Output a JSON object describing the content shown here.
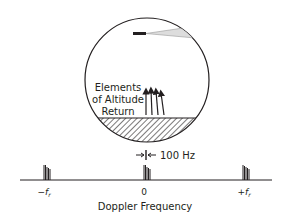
{
  "diagram": {
    "circle_labels": [
      "Elements",
      "of Altitude",
      "Return"
    ],
    "resolution_label": "100 Hz",
    "axis_title": "Doppler Frequency",
    "ticks": [
      {
        "label": "−f",
        "sub": "r"
      },
      {
        "label": "0",
        "sub": ""
      },
      {
        "label": "+f",
        "sub": "r"
      }
    ],
    "colors": {
      "ink": "#231f20",
      "beam": "#bbbbbb"
    }
  }
}
